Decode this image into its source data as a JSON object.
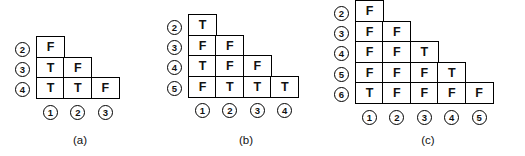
{
  "figure": {
    "background_color": "#ffffff",
    "line_color": "#000000",
    "text_color": "#111111",
    "panels": [
      {
        "id": "a",
        "caption": "(a)",
        "row_labels": [
          "2",
          "3",
          "4"
        ],
        "col_labels": [
          "1",
          "2",
          "3"
        ],
        "rows": [
          [
            "F"
          ],
          [
            "T",
            "F"
          ],
          [
            "T",
            "T",
            "F"
          ]
        ],
        "origin_x": 36,
        "origin_y": 38,
        "caption_x": 80,
        "caption_y": 134
      },
      {
        "id": "b",
        "caption": "(b)",
        "row_labels": [
          "2",
          "3",
          "4",
          "5"
        ],
        "col_labels": [
          "1",
          "2",
          "3",
          "4"
        ],
        "rows": [
          [
            "T"
          ],
          [
            "F",
            "F"
          ],
          [
            "T",
            "F",
            "F"
          ],
          [
            "F",
            "T",
            "T",
            "T"
          ]
        ],
        "origin_x": 188,
        "origin_y": 16,
        "caption_x": 246,
        "caption_y": 134
      },
      {
        "id": "c",
        "caption": "(c)",
        "row_labels": [
          "2",
          "3",
          "4",
          "5",
          "6"
        ],
        "col_labels": [
          "1",
          "2",
          "3",
          "4",
          "5"
        ],
        "rows": [
          [
            "F"
          ],
          [
            "F",
            "F"
          ],
          [
            "F",
            "F",
            "T"
          ],
          [
            "F",
            "F",
            "F",
            "T"
          ],
          [
            "T",
            "F",
            "F",
            "F",
            "F"
          ]
        ],
        "origin_x": 355,
        "origin_y": 2,
        "caption_x": 428,
        "caption_y": 134
      }
    ],
    "cell_width": 29,
    "cell_height": 22
  }
}
